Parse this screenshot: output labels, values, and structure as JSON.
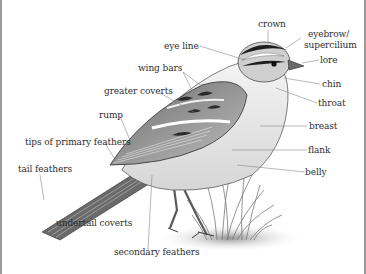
{
  "diagram": {
    "labels": {
      "crown": "crown",
      "eyebrow": "eyebrow/",
      "supercilium": "supercilium",
      "lore": "lore",
      "eye_line": "eye line",
      "chin": "chin",
      "throat": "throat",
      "wing_bars": "wing bars",
      "greater_coverts": "greater coverts",
      "rump": "rump",
      "tips_of_primary_feathers": "tips of primary feathers",
      "breast": "breast",
      "flank": "flank",
      "belly": "belly",
      "tail_feathers": "tail feathers",
      "undertail_coverts": "undertail coverts",
      "secondary_feathers": "secondary feathers"
    },
    "colors": {
      "background": "#ffffff",
      "ink": "#2e2e2e",
      "leader_line": "#8a8a8a",
      "bird_dark": "#3a3a3a",
      "bird_mid": "#8c8c8c",
      "bird_light": "#d8d8d8",
      "frame": "#9a9a9a"
    }
  }
}
